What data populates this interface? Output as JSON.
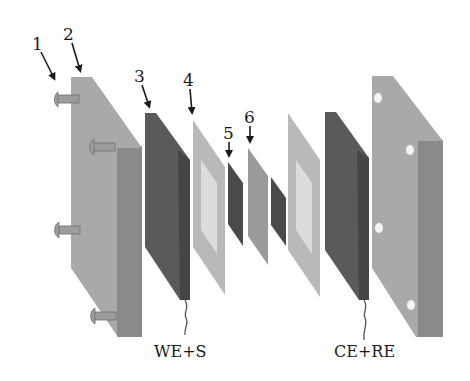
{
  "figure": {
    "callouts": [
      {
        "id": "1",
        "label": "1",
        "x": 34,
        "y": 46
      },
      {
        "id": "2",
        "label": "2",
        "x": 65,
        "y": 36
      },
      {
        "id": "3",
        "label": "3",
        "x": 136,
        "y": 78
      },
      {
        "id": "4",
        "label": "4",
        "x": 184,
        "y": 82
      },
      {
        "id": "5",
        "label": "5",
        "x": 223,
        "y": 135
      },
      {
        "id": "6",
        "label": "6",
        "x": 244,
        "y": 119
      }
    ],
    "captions": {
      "we_s": "WE+S",
      "ce_re": "CE+RE"
    },
    "colors": {
      "end_plate_face": "#a9a9a9",
      "end_plate_side": "#8a8a8a",
      "electrode_dark": "#5a5a5a",
      "electrode_dark_side": "#454545",
      "gasket_light": "#b9b9b9",
      "gasket_window": "#dcdcdc",
      "membrane_mid": "#9a9a9a",
      "thin_dark": "#4a4a4a",
      "screw": "#9c9c9c",
      "hole": "#f4f4f4",
      "text": "#1a1a1a"
    }
  }
}
